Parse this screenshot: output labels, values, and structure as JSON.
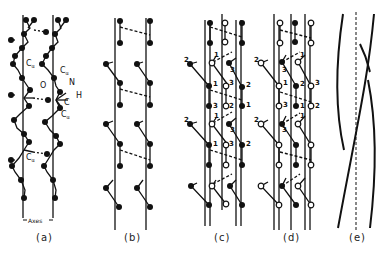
{
  "figure": {
    "type": "structural diagram of helical polypeptide chains",
    "panels": [
      {
        "id": "a",
        "label": "(a)",
        "description": "ball-and-stick chain segments along two axes with hydrogen bonds"
      },
      {
        "id": "b",
        "label": "(b)",
        "description": "simplified two-chain representation with dashed H-bonds"
      },
      {
        "id": "c",
        "label": "(c)",
        "description": "three-chain arrangement with numbered residues, filled and open atoms"
      },
      {
        "id": "d",
        "label": "(d)",
        "description": "alternate three-chain arrangement with numbered residues"
      },
      {
        "id": "e",
        "label": "(e)",
        "description": "supercoiled strands twisting about a dashed central axis"
      }
    ],
    "panel_a_labels": {
      "c_alpha_1": "C",
      "c_alpha_sub": "α",
      "oxygen": "O",
      "nitrogen": "N",
      "hydrogen": "H",
      "carbon": "C",
      "axes": "Axes"
    },
    "residue_numbers": [
      "1",
      "2",
      "3"
    ],
    "colors": {
      "ink": "#111111",
      "background": "#ffffff"
    }
  }
}
